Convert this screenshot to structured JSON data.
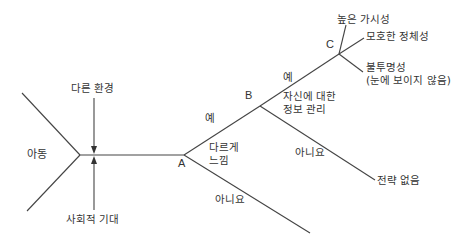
{
  "diagram": {
    "type": "decision-tree",
    "start": {
      "label": "아동"
    },
    "inputs": [
      {
        "label": "다른 환경",
        "direction": "down"
      },
      {
        "label": "사회적 기대",
        "direction": "up"
      }
    ],
    "nodes": {
      "A": {
        "label": "A",
        "question": [
          "다르게",
          "느낌"
        ],
        "yes": "예",
        "no": "아니요"
      },
      "B": {
        "label": "B",
        "question": [
          "자신에 대한",
          "정보 관리"
        ],
        "yes": "예",
        "no": "아니요"
      },
      "C": {
        "label": "C"
      }
    },
    "outcomes": {
      "no_strategy": "전략 없음",
      "high_visibility": "높은 가시성",
      "ambiguous_identity": "모호한 정체성",
      "opacity_line1": "불투명성",
      "opacity_line2": "(눈에 보이지 않음)"
    },
    "line_color": "#333333"
  }
}
